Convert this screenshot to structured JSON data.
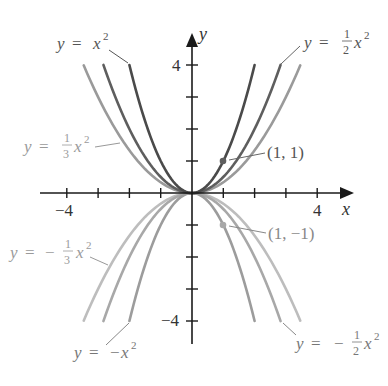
{
  "chart_data": {
    "type": "line",
    "title": "",
    "xlabel": "x",
    "ylabel": "y",
    "xlim": [
      -4.6,
      5
    ],
    "ylim": [
      -4.6,
      5
    ],
    "grid": false,
    "legend": "none (curves labeled directly)",
    "x_ticks": [
      -4,
      -3,
      -2,
      -1,
      1,
      2,
      3,
      4
    ],
    "y_ticks": [
      -4,
      -3,
      -2,
      -1,
      1,
      2,
      3,
      4
    ],
    "x_tick_labels": [
      {
        "value": -4,
        "text": "−4"
      },
      {
        "value": 4,
        "text": "4"
      }
    ],
    "y_tick_labels": [
      {
        "value": 4,
        "text": "4"
      },
      {
        "value": -4,
        "text": "−4"
      }
    ],
    "series": [
      {
        "name": "y = x^2",
        "a": 1,
        "x_range": [
          -2,
          2
        ],
        "color": "#4a4a4a"
      },
      {
        "name": "y = 1/2 x^2",
        "a": 0.5,
        "x_range": [
          -2.83,
          2.83
        ],
        "color": "#5e5e5e"
      },
      {
        "name": "y = 1/3 x^2",
        "a": 0.3333,
        "x_range": [
          -3.46,
          3.46
        ],
        "color": "#9a9a9a"
      },
      {
        "name": "y = -x^2",
        "a": -1,
        "x_range": [
          -2,
          2
        ],
        "color": "#9c9c9c"
      },
      {
        "name": "y = -1/2 x^2",
        "a": -0.5,
        "x_range": [
          -2.83,
          2.83
        ],
        "color": "#a8a8a8"
      },
      {
        "name": "y = -1/3 x^2",
        "a": -0.3333,
        "x_range": [
          -3.46,
          3.46
        ],
        "color": "#bdbdbd"
      }
    ],
    "points": [
      {
        "x": 1,
        "y": 1,
        "label": "(1, 1)",
        "color": "#5e5e5e"
      },
      {
        "x": 1,
        "y": -1,
        "label": "(1, −1)",
        "color": "#a8a8a8"
      }
    ],
    "annotations": [
      {
        "text": "y = x²",
        "target": "y = x^2"
      },
      {
        "text": "y = ½x²",
        "target": "y = 1/2 x^2"
      },
      {
        "text": "y = ⅓x²",
        "target": "y = 1/3 x^2"
      },
      {
        "text": "y = −x²",
        "target": "y = -x^2"
      },
      {
        "text": "y = −½x²",
        "target": "y = -1/2 x^2"
      },
      {
        "text": "y = −⅓x²",
        "target": "y = -1/3 x^2"
      }
    ]
  },
  "axis": {
    "x_label": "x",
    "y_label": "y",
    "x_neg4": "−4",
    "x_pos4": "4",
    "y_pos4": "4",
    "y_neg4": "−4"
  },
  "labels": {
    "x2": {
      "y": "y",
      "eq": "=",
      "x": "x",
      "exp": "2"
    },
    "half": {
      "y": "y",
      "eq": "=",
      "num": "1",
      "den": "2",
      "x": "x",
      "exp": "2"
    },
    "third": {
      "y": "y",
      "eq": "=",
      "num": "1",
      "den": "3",
      "x": "x",
      "exp": "2"
    },
    "neg_x2": {
      "y": "y",
      "eq": "=",
      "minus": "−",
      "x": "x",
      "exp": "2"
    },
    "neg_half": {
      "y": "y",
      "eq": "=",
      "minus": "−",
      "num": "1",
      "den": "2",
      "x": "x",
      "exp": "2"
    },
    "neg_third": {
      "y": "y",
      "eq": "=",
      "minus": "−",
      "num": "1",
      "den": "3",
      "x": "x",
      "exp": "2"
    },
    "pt1": "(1, 1)",
    "pt2": "(1, −1)"
  },
  "colors": {
    "axis": "#1a1a1a",
    "label_dark": "#555555",
    "label_light": "#9a9a9a"
  }
}
